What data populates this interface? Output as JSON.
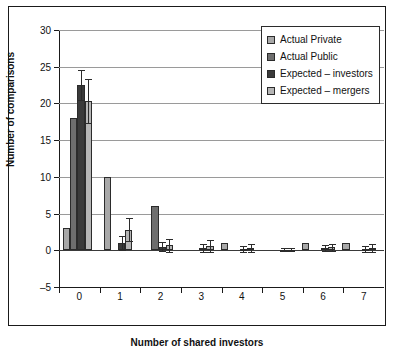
{
  "chart_data": {
    "type": "bar",
    "title": "",
    "xlabel": "Number of shared investors",
    "ylabel": "Number of comparisons",
    "categories": [
      "0",
      "1",
      "2",
      "3",
      "4",
      "5",
      "6",
      "7"
    ],
    "ylim": [
      -5,
      30
    ],
    "yticks": [
      -5,
      0,
      5,
      10,
      15,
      20,
      25,
      30
    ],
    "grid": true,
    "legend_position": "top-right",
    "series": [
      {
        "name": "Actual Private",
        "color": "#a8a8a8",
        "values": [
          3,
          10,
          0,
          0,
          0,
          0,
          0,
          0
        ],
        "errors": [
          null,
          null,
          null,
          null,
          null,
          null,
          null,
          null
        ]
      },
      {
        "name": "Actual Public",
        "color": "#6e6e6e",
        "values": [
          18,
          0,
          6,
          0,
          0,
          0,
          0,
          0
        ],
        "errors": [
          null,
          null,
          null,
          null,
          null,
          null,
          null,
          null
        ]
      },
      {
        "name": "Expected – investors",
        "color": "#3a3a3a",
        "values": [
          22.5,
          1.0,
          0.5,
          0.3,
          0.2,
          0.1,
          0.3,
          0.2
        ],
        "errors": [
          2.1,
          1.0,
          0.6,
          0.5,
          0.4,
          0.2,
          0.4,
          0.4
        ]
      },
      {
        "name": "Expected – mergers",
        "color": "#b5b5b5",
        "values": [
          20.3,
          2.8,
          0.7,
          0.6,
          0.3,
          0.1,
          0.4,
          0.3
        ],
        "errors": [
          3.0,
          1.6,
          0.9,
          0.8,
          0.5,
          0.2,
          0.5,
          0.5
        ]
      }
    ],
    "extra_bars": [
      {
        "category": "3",
        "value": 1,
        "color": "#a8a8a8",
        "note": "light bar right of cluster 3"
      },
      {
        "category": "5",
        "value": 1,
        "color": "#a8a8a8",
        "note": "light bar right of cluster 5"
      },
      {
        "category": "6",
        "value": 1,
        "color": "#a8a8a8",
        "note": "light bar right of cluster 6"
      }
    ]
  },
  "legend": {
    "items": [
      {
        "label": "Actual Private",
        "color": "#a8a8a8"
      },
      {
        "label": "Actual Public",
        "color": "#6e6e6e"
      },
      {
        "label": "Expected – investors",
        "color": "#3a3a3a"
      },
      {
        "label": "Expected – mergers",
        "color": "#b5b5b5"
      }
    ]
  }
}
